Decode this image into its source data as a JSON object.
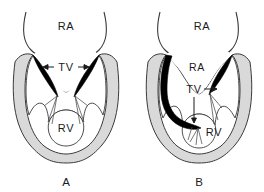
{
  "figure": {
    "background_color": "#ffffff",
    "ink_color": "#1a1a1a",
    "myocardium_fill": "#d9d9d9",
    "leaflet_fill": "#000000",
    "cavity_fill": "#ffffff",
    "width": 264,
    "height": 192
  },
  "panels": [
    {
      "id": "A",
      "letter": "A",
      "labels": {
        "atrium": "RA",
        "ventricle": "RV",
        "valve": "TV"
      },
      "valve_arrows": [
        "left",
        "right"
      ],
      "description": "normal tricuspid valve"
    },
    {
      "id": "B",
      "letter": "B",
      "labels": {
        "atrium": "RA",
        "atrialized_chamber": "RA",
        "ventricle": "RV",
        "valve": "TV"
      },
      "valve_arrows": [
        "right",
        "down"
      ],
      "description": "displaced tricuspid valve with atrialized right ventricle"
    }
  ]
}
